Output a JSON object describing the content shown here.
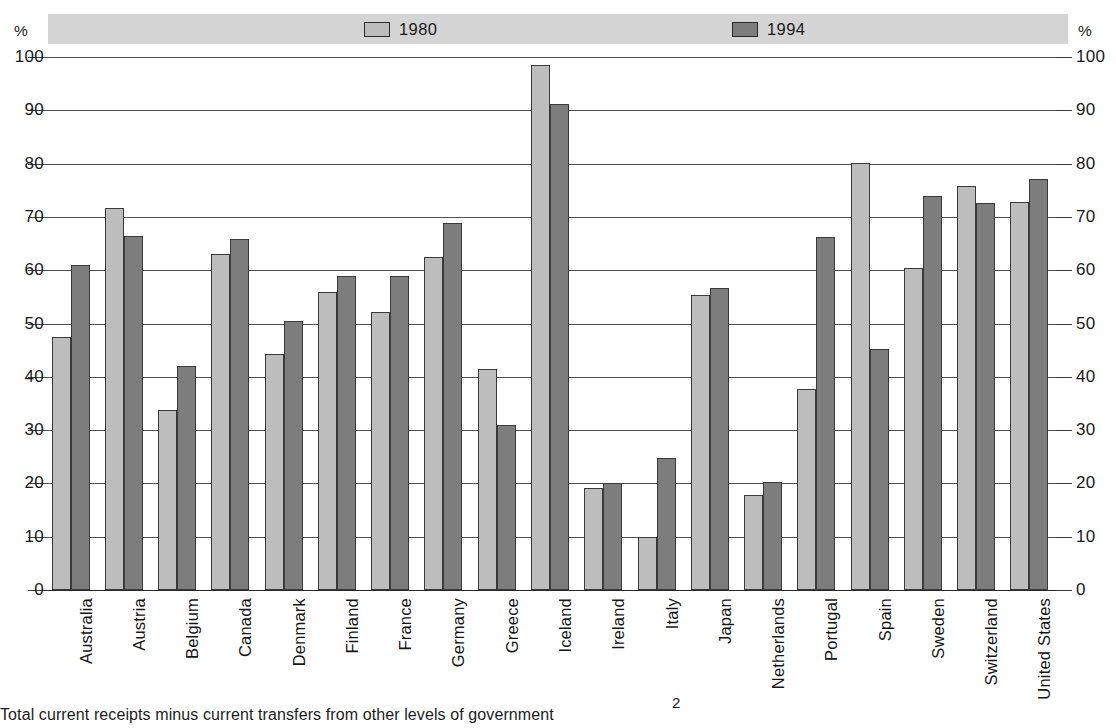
{
  "chart_data": {
    "type": "bar",
    "title": "",
    "xlabel": "",
    "ylabel": "%",
    "ylim": [
      0,
      100
    ],
    "ytick_values": [
      100,
      90,
      80,
      70,
      60,
      50,
      40,
      30,
      20,
      10,
      0
    ],
    "ytick_labels": [
      "100",
      "90",
      "80",
      "70",
      "60",
      "50",
      "40",
      "30",
      "20",
      "10",
      "0"
    ],
    "ytick_labels_right": [
      "100",
      "90",
      "80",
      "70",
      "60",
      "50",
      "40",
      "30",
      "20",
      "10",
      "0"
    ],
    "grid": true,
    "legend_position": "top",
    "axis_unit_left": "%",
    "axis_unit_right": "%",
    "categories": [
      "Australia",
      "Austria",
      "Belgium",
      "Canada",
      "Denmark",
      "Finland",
      "France",
      "Germany",
      "Greece",
      "Iceland",
      "Ireland",
      "Italy",
      "Japan",
      "Netherlands",
      "Portugal",
      "Spain",
      "Sweden",
      "Switzerland",
      "United States"
    ],
    "series": [
      {
        "name": "1980",
        "color": "#bdbdbd",
        "values": [
          47.5,
          71.7,
          33.7,
          63.0,
          44.2,
          56.0,
          52.2,
          62.5,
          41.5,
          98.5,
          19.2,
          10.0,
          55.4,
          17.8,
          37.7,
          80.2,
          60.5,
          75.8,
          72.8
        ]
      },
      {
        "name": "1994",
        "color": "#7d7d7d",
        "values": [
          61.0,
          66.5,
          42.0,
          65.8,
          50.5,
          59.0,
          59.0,
          68.8,
          31.0,
          91.2,
          20.0,
          24.7,
          56.7,
          20.2,
          66.2,
          45.3,
          74.0,
          72.7,
          77.2
        ]
      }
    ]
  },
  "legend": {
    "items": [
      {
        "label": "1980",
        "swatch": "#bdbdbd"
      },
      {
        "label": "1994",
        "swatch": "#7d7d7d"
      }
    ]
  },
  "footnote": {
    "marker": "2",
    "text": "Total current receipts minus current transfers from other levels of government"
  },
  "colors": {
    "series_1980": "#bdbdbd",
    "series_1994": "#7d7d7d",
    "legend_band": "#d4d4d4",
    "gridline": "#50504f",
    "axis": "#2a2a2a",
    "text": "#1a1a1a"
  }
}
